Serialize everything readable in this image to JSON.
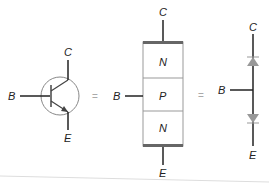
{
  "diagram": {
    "colors": {
      "line": "#222222",
      "circle": "#888888",
      "block_border": "#999999",
      "block_bar": "#666666",
      "diode_fill": "#999999",
      "equals": "#aaaaaa",
      "footer_rule": "#dddddd"
    },
    "symbol": {
      "base_label": "B",
      "collector_label": "C",
      "emitter_label": "E"
    },
    "equals_1": "=",
    "block": {
      "base_label": "B",
      "collector_label": "C",
      "emitter_label": "E",
      "layers": [
        "N",
        "P",
        "N"
      ]
    },
    "equals_2": "=",
    "diode_model": {
      "base_label": "B",
      "collector_label": "C",
      "emitter_label": "E",
      "diodes": [
        "base-collector diode",
        "base-emitter diode"
      ]
    }
  }
}
